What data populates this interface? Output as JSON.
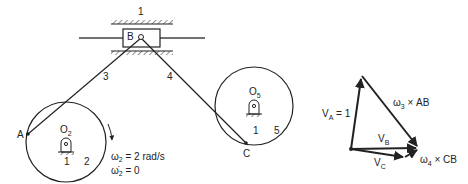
{
  "mechanism": {
    "frame_label": "1",
    "slider_label": "B",
    "link3_label": "3",
    "link4_label": "4",
    "point_a_label": "A",
    "point_c_label": "C",
    "crank2": {
      "pivot_label": "O",
      "pivot_sub": "2",
      "ground_label": "1",
      "link_label": "2"
    },
    "crank5": {
      "pivot_label": "O",
      "pivot_sub": "5",
      "ground_label": "1",
      "link_label": "5"
    },
    "omega2_text": "ω",
    "omega2_sub": "2",
    "omega2_value": " = 2 rad/s",
    "alpha2_text": "ω̇",
    "alpha2_sub": "2",
    "alpha2_value": " = 0"
  },
  "velocity_polygon": {
    "va_label": "V",
    "va_sub": "A",
    "va_value": " = 1",
    "vb_label": "V",
    "vb_sub": "B",
    "vc_label": "V",
    "vc_sub": "C",
    "w3ab_label": "ω",
    "w3ab_sub": "3",
    "w3ab_rest": " × AB",
    "w4cb_label": "ω",
    "w4cb_sub": "4",
    "w4cb_rest": " × CB"
  },
  "colors": {
    "ink": "#222222"
  }
}
